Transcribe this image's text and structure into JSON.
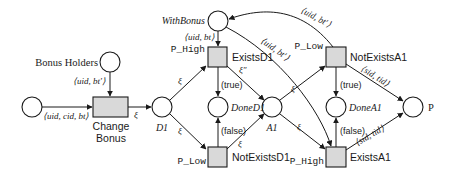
{
  "diagram": {
    "type": "petri-net",
    "places": {
      "start": {
        "label": ""
      },
      "bonus_holders": {
        "label": "Bonus Holders"
      },
      "d1": {
        "label": "D1"
      },
      "with_bonus": {
        "label": "WithBonus"
      },
      "done_d1": {
        "label": "DoneD1"
      },
      "a1": {
        "label": "A1"
      },
      "done_a1": {
        "label": "DoneA1"
      },
      "p": {
        "label": "P"
      }
    },
    "transitions": {
      "change_bonus": {
        "label_line1": "Change",
        "label_line2": "Bonus"
      },
      "exists_d1": {
        "label": "ExistsD1",
        "priority": "P_High"
      },
      "not_exists_d1": {
        "label": "NotExistsD1",
        "priority": "P_Low"
      },
      "not_exists_a1": {
        "label": "NotExistsA1",
        "priority": "P_Low"
      },
      "exists_a1": {
        "label": "ExistsA1",
        "priority": "P_High"
      }
    },
    "arcs": {
      "start_to_change": "⟨uid, cid, bt⟩",
      "holders_to_change": "⟨uid, bt′⟩",
      "change_to_d1": "ξ",
      "d1_to_exists_d1": "ξ",
      "d1_to_not_exists_d1": "ξ",
      "withbonus_to_exists_d1": "⟨uid, bt⟩",
      "exists_d1_to_done_d1": "(true)",
      "not_exists_d1_to_done_d1": "(false)",
      "exists_d1_to_a1": "ξ″",
      "not_exists_d1_to_a1": "ξ",
      "withbonus_to_exists_a1": "⟨uid, bt′⟩",
      "not_exists_a1_to_withbonus": "⟨uid, bt′⟩",
      "a1_to_not_exists_a1": "ξ",
      "a1_to_exists_a1": "ξ",
      "not_exists_a1_to_done_a1": "(true)",
      "exists_a1_to_done_a1": "(false)",
      "not_exists_a1_to_p": "⟨sid, tid⟩",
      "exists_a1_to_p": "⟨sid, tid⟩"
    },
    "colors": {
      "stroke": "#1a1a1a",
      "transition_fill": "#d9d9d9",
      "place_fill": "#ffffff"
    }
  }
}
